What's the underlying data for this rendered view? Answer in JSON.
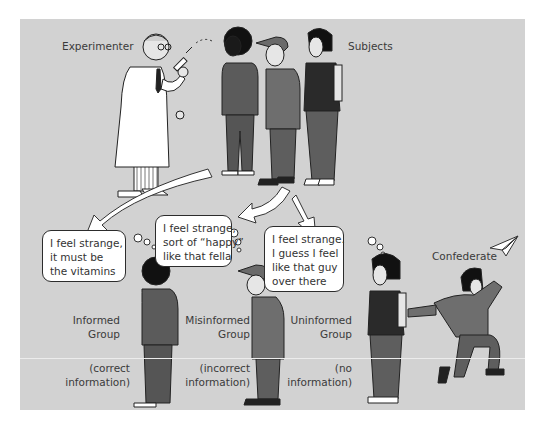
{
  "figure": {
    "labels": {
      "experimenter": "Experimenter",
      "subjects": "Subjects",
      "confederate": "Confederate"
    },
    "groups": [
      {
        "name_lines": [
          "Informed",
          "Group"
        ],
        "info_lines": [
          "(correct",
          "information)"
        ],
        "thought_lines": [
          "I feel strange,",
          "it must be",
          "the vitamins"
        ]
      },
      {
        "name_lines": [
          "Misinformed",
          "Group"
        ],
        "info_lines": [
          "(incorrect",
          "information)"
        ],
        "thought_lines": [
          "I feel strange,",
          "sort of “happy”",
          "like that fella"
        ]
      },
      {
        "name_lines": [
          "Uninformed",
          "Group"
        ],
        "info_lines": [
          "(no",
          "information)"
        ],
        "thought_lines": [
          "I feel strange.",
          "I guess I feel",
          "like that guy",
          "over there"
        ]
      }
    ],
    "colors": {
      "background": "#d2d2d2",
      "clothing_dark": "#5b5b5b",
      "clothing_mid": "#6e6e6e",
      "outline": "#222222",
      "bubble_fill": "#ffffff"
    },
    "icons": [
      "syringe-icon",
      "paper-airplane-icon",
      "arrow-icon"
    ]
  }
}
